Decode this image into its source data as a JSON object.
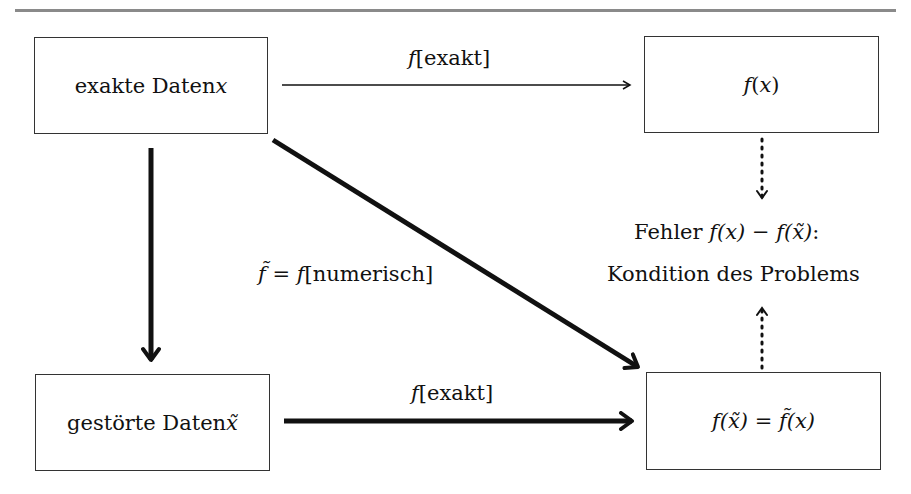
{
  "diagram": {
    "nodes": {
      "exact_data": {
        "text": "exakte Daten ",
        "var": "x"
      },
      "exact_result": {
        "f": "f",
        "open": "(",
        "var": "x",
        "close": ")"
      },
      "perturbed_data": {
        "text": "gestörte Daten ",
        "var": "x̃"
      },
      "perturbed_result": {
        "lhs_f": "f",
        "lhs_arg": "(x̃)",
        "eq": " = ",
        "rhs_f": "f̃",
        "rhs_arg": "(x)"
      }
    },
    "edges": {
      "top_label": {
        "f": "f",
        "rest": "[exakt]"
      },
      "bottom_label": {
        "f": "f",
        "rest": "[exakt]"
      },
      "diagonal_label": {
        "ftilde": "f̃",
        "eq": " = ",
        "f": "f",
        "rest": "[numerisch]"
      }
    },
    "error_note": {
      "line1_text": "Fehler ",
      "line1_math": "f(x) − f(x̃)",
      "line1_colon": ":",
      "line2": "Kondition des Problems"
    },
    "colors": {
      "rule": "#8a8a8a",
      "stroke": "#111111",
      "box_border": "#333333"
    }
  }
}
